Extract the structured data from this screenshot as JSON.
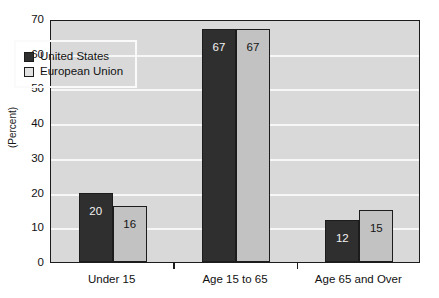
{
  "chart_data": {
    "type": "bar",
    "title": "",
    "xlabel": "",
    "ylabel": "(Percent)",
    "ylim": [
      0,
      70
    ],
    "ytick_step": 10,
    "yticks": [
      0,
      10,
      20,
      30,
      40,
      50,
      60,
      70
    ],
    "grid": true,
    "legend_position": "inside-upper-left",
    "categories": [
      "Under 15",
      "Age 15 to 65",
      "Age 65 and Over"
    ],
    "series": [
      {
        "name": "United States",
        "color": "#2f2f2f",
        "values": [
          20,
          67,
          12
        ],
        "labels": [
          "20",
          "67",
          "12"
        ]
      },
      {
        "name": "European Union",
        "color": "#c2c2c2",
        "values": [
          16,
          67,
          15
        ],
        "labels": [
          "16",
          "67",
          "15"
        ]
      }
    ]
  },
  "axis": {
    "y_title": "(Percent)",
    "y_tick_labels": [
      "70",
      "60",
      "50",
      "40",
      "30",
      "20",
      "10",
      "0"
    ]
  },
  "legend": {
    "items": [
      {
        "label": "United States",
        "swatch": "dark-swatch-icon"
      },
      {
        "label": "European Union",
        "swatch": "light-swatch-icon"
      }
    ]
  },
  "colors": {
    "plot_background": "#d9d9d9",
    "gridline": "#f7f7f7",
    "axis": "#1c1c1c",
    "series_us": "#2f2f2f",
    "series_eu": "#c2c2c2",
    "page_background": "#ffffff"
  }
}
